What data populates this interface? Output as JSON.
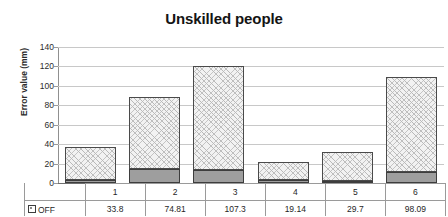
{
  "chart_data": {
    "type": "bar",
    "title": "Unskilled people",
    "xlabel": "",
    "ylabel": "Error value (mm)",
    "ylim": [
      0,
      140
    ],
    "ytick_step": 20,
    "yticks": [
      0,
      20,
      40,
      60,
      80,
      100,
      120,
      140
    ],
    "grid": true,
    "stacked": true,
    "legend_position": "data-table-row",
    "categories": [
      "1",
      "2",
      "3",
      "4",
      "5",
      "6"
    ],
    "series": [
      {
        "name": "base",
        "fill": "solid-gray",
        "values": [
          3,
          14,
          13,
          3,
          2,
          11
        ]
      },
      {
        "name": "upper",
        "fill": "hatched",
        "values": [
          34,
          75,
          107,
          19,
          30,
          98
        ]
      }
    ],
    "totals": [
      37,
      89,
      120,
      22,
      32,
      109
    ],
    "data_table": {
      "row_label": "OFF",
      "row_marker": "legend-swatch-hatched",
      "values": [
        "33.8",
        "74.81",
        "107.3",
        "19.14",
        "29.7",
        "98.09"
      ]
    }
  },
  "colors": {
    "bar_fill_light": "#f2f2f2",
    "bar_fill_dark": "#9e9e9e",
    "bar_border": "#4a4a4a",
    "gridline": "#c8c8c8",
    "axis": "#6e6e6e",
    "text": "#1a1a1a"
  }
}
